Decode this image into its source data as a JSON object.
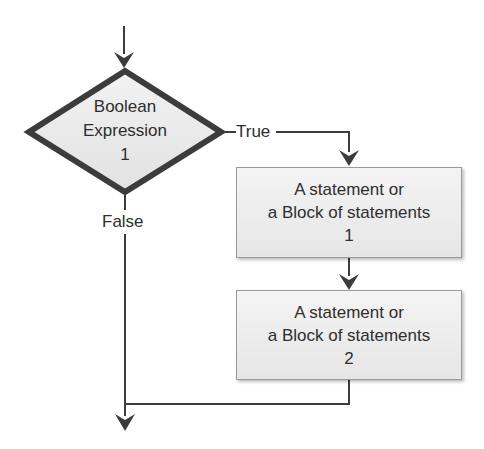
{
  "diagram": {
    "type": "flowchart",
    "decision": {
      "line1": "Boolean",
      "line2": "Expression",
      "line3": "1"
    },
    "edges": {
      "true_label": "True",
      "false_label": "False"
    },
    "statement1": {
      "line1": "A statement or",
      "line2": "a Block of statements",
      "line3": "1"
    },
    "statement2": {
      "line1": "A statement or",
      "line2": "a Block of statements",
      "line3": "2"
    },
    "colors": {
      "stroke": "#3c3c3c",
      "box_fill": "#ececec",
      "box_border": "#9a9a9a",
      "text": "#2e2e2e"
    }
  }
}
